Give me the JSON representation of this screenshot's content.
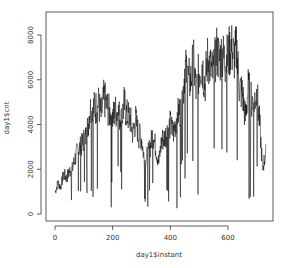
{
  "chart_data": {
    "type": "line",
    "title": "",
    "xlabel": "day1$instant",
    "ylabel": "day1$cnt",
    "xlim": [
      0,
      731
    ],
    "ylim": [
      0,
      8714
    ],
    "x_ticks": [
      0,
      200,
      400,
      600
    ],
    "y_ticks": [
      0,
      2000,
      4000,
      6000,
      8000
    ],
    "grid": false,
    "legend": null,
    "series": [
      {
        "name": "day1$cnt",
        "color": "#000000",
        "x": [
          1,
          10,
          20,
          30,
          40,
          50,
          60,
          70,
          80,
          90,
          100,
          110,
          120,
          130,
          140,
          150,
          160,
          170,
          180,
          190,
          200,
          210,
          220,
          230,
          240,
          250,
          260,
          270,
          280,
          290,
          300,
          310,
          320,
          330,
          340,
          350,
          360,
          370,
          380,
          390,
          400,
          410,
          420,
          430,
          440,
          450,
          460,
          470,
          480,
          490,
          500,
          510,
          520,
          530,
          540,
          550,
          560,
          570,
          580,
          590,
          600,
          610,
          620,
          630,
          640,
          650,
          660,
          670,
          680,
          690,
          700,
          710,
          720,
          731
        ],
        "values": [
          985,
          1400,
          1200,
          1800,
          1600,
          1900,
          2000,
          2500,
          2900,
          3000,
          3300,
          3500,
          4600,
          4800,
          4700,
          5000,
          4400,
          5200,
          4800,
          4500,
          4300,
          4600,
          4500,
          4200,
          4900,
          4400,
          4300,
          3600,
          4200,
          3500,
          3400,
          2400,
          2600,
          3000,
          3600,
          2900,
          2300,
          3300,
          3400,
          3700,
          4000,
          3600,
          4200,
          4600,
          4500,
          6500,
          6100,
          5900,
          6800,
          5400,
          6400,
          6700,
          5800,
          7000,
          6500,
          6200,
          7300,
          6900,
          7100,
          6800,
          7000,
          7500,
          7000,
          7300,
          5600,
          5400,
          4300,
          5600,
          5100,
          5000,
          5400,
          4000,
          2000,
          2729
        ]
      }
    ]
  }
}
